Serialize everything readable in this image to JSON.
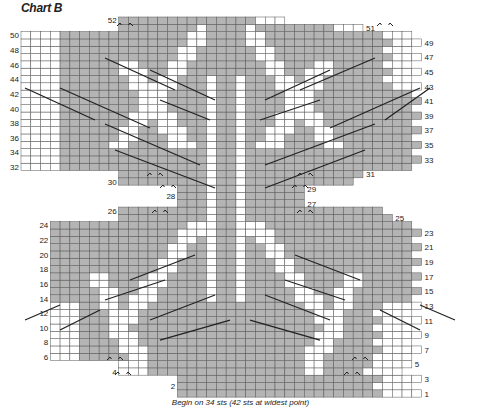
{
  "title": "Chart B",
  "caption": "Begin on 34 sts (42 sts at widest point)",
  "colors": {
    "grey": "#b4b4b4",
    "white": "#ffffff",
    "grid": "#555555",
    "cable": "#222222"
  },
  "grid": {
    "cols": 42,
    "rows": 52,
    "x0": 21,
    "y0": 17,
    "cell_w": 9.77,
    "cell_h": 7.31
  },
  "row_numbers": {
    "left_even": [
      50,
      48,
      46,
      44,
      42,
      40,
      38,
      36,
      34,
      32,
      30,
      28,
      26,
      24,
      22,
      20,
      18,
      16,
      14,
      12,
      10,
      8,
      6,
      4,
      2
    ],
    "right_odd": [
      51,
      49,
      47,
      45,
      43,
      41,
      39,
      37,
      35,
      33,
      31,
      29,
      27,
      25,
      23,
      21,
      19,
      17,
      15,
      13,
      11,
      9,
      7,
      5,
      3,
      1
    ],
    "top_label": 52
  },
  "row_extents": {
    "comment": "per row (1 = bottom) leftmost and rightmost column indices occupied (0-based, 42 cols)",
    "rows": [
      [
        17,
        40
      ],
      [
        16,
        39
      ],
      [
        16,
        40
      ],
      [
        10,
        38
      ],
      [
        10,
        39
      ],
      [
        3,
        38
      ],
      [
        3,
        39
      ],
      [
        3,
        38
      ],
      [
        3,
        39
      ],
      [
        3,
        38
      ],
      [
        3,
        39
      ],
      [
        3,
        38
      ],
      [
        3,
        39
      ],
      [
        3,
        38
      ],
      [
        3,
        39
      ],
      [
        3,
        38
      ],
      [
        3,
        39
      ],
      [
        3,
        38
      ],
      [
        3,
        39
      ],
      [
        3,
        38
      ],
      [
        3,
        39
      ],
      [
        3,
        38
      ],
      [
        3,
        39
      ],
      [
        3,
        38
      ],
      [
        10,
        36
      ],
      [
        10,
        36
      ],
      [
        12,
        30
      ],
      [
        12,
        30
      ],
      [
        10,
        33
      ],
      [
        10,
        33
      ],
      [
        3,
        36
      ],
      [
        3,
        38
      ],
      [
        3,
        39
      ],
      [
        3,
        38
      ],
      [
        3,
        39
      ],
      [
        3,
        38
      ],
      [
        3,
        39
      ],
      [
        3,
        38
      ],
      [
        3,
        39
      ],
      [
        3,
        38
      ],
      [
        3,
        39
      ],
      [
        3,
        38
      ],
      [
        3,
        39
      ],
      [
        3,
        38
      ],
      [
        3,
        39
      ],
      [
        3,
        38
      ],
      [
        3,
        39
      ],
      [
        3,
        38
      ],
      [
        3,
        39
      ],
      [
        3,
        37
      ],
      [
        10,
        36
      ],
      [
        10,
        26
      ]
    ]
  }
}
